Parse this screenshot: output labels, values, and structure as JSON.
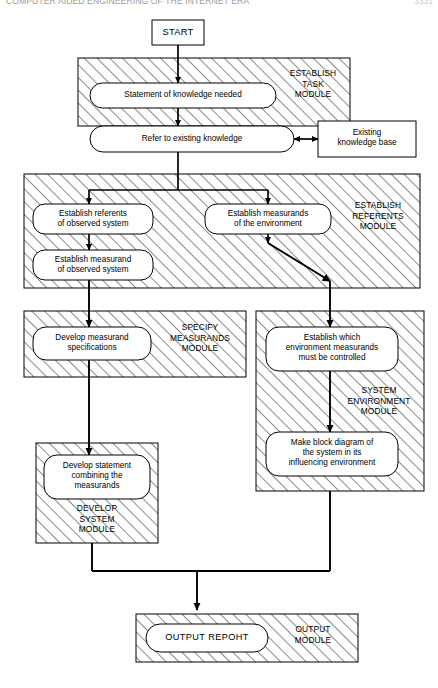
{
  "header": {
    "title": "COMPUTER AIDED ENGINEERING OF THE INTERNET ERA",
    "page": "3331"
  },
  "diagram": {
    "colors": {
      "stroke": "#000000",
      "fill": "#ffffff",
      "hatch": "#000000",
      "background": "#ffffff"
    },
    "start": {
      "label": "START"
    },
    "modules": [
      {
        "id": "establish-task",
        "label": "ESTABLISH\nTASK\nMODULE",
        "x": 78,
        "y": 58,
        "w": 272,
        "h": 68
      },
      {
        "id": "establish-referents",
        "label": "ESTABLISH\nREFERENTS\nMODULE",
        "x": 24,
        "y": 174,
        "w": 396,
        "h": 114
      },
      {
        "id": "specify-measurands",
        "label": "SPECIFY\nMEASURANDS\nMODULE",
        "x": 24,
        "y": 311,
        "w": 222,
        "h": 66
      },
      {
        "id": "system-environment",
        "label": "SYSTEM\nENVIRONMENT\nMODULE",
        "x": 256,
        "y": 311,
        "w": 168,
        "h": 180
      },
      {
        "id": "develop-system",
        "label": "DEVELOP\nSYSTEM\nMODULE",
        "x": 36,
        "y": 443,
        "w": 122,
        "h": 100
      },
      {
        "id": "output",
        "label": "OUTPUT\nMODULE",
        "x": 136,
        "y": 614,
        "w": 222,
        "h": 48
      }
    ],
    "nodes": [
      {
        "id": "statement-knowledge",
        "label": "Statement of knowledge needed"
      },
      {
        "id": "refer-existing-knowledge",
        "label": "Refer to existing knowledge"
      },
      {
        "id": "existing-knowledge-base",
        "label": "Existing\nknowledge base"
      },
      {
        "id": "establish-referents-observed",
        "label": "Establish referents\nof observed system"
      },
      {
        "id": "establish-measurand-observed",
        "label": "Establish measurand\nof observed system"
      },
      {
        "id": "establish-measurands-environment",
        "label": "Establish measurands\nof the environment"
      },
      {
        "id": "develop-measurand-specifications",
        "label": "Develop measurand\nspecifications"
      },
      {
        "id": "establish-environment-controlled",
        "label": "Establish which\nenvironment measurands\nmust be controlled"
      },
      {
        "id": "make-block-diagram",
        "label": "Make block diagram of\nthe system in its\ninfluencing environment"
      },
      {
        "id": "develop-statement-combining",
        "label": "Develop statement\ncombining the\nmeasurands"
      },
      {
        "id": "output-report",
        "label": "OUTPUT REPOHT"
      }
    ]
  }
}
